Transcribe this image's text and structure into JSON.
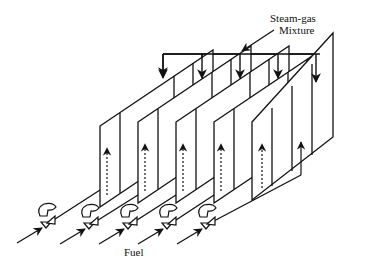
{
  "diagram": {
    "type": "schematic",
    "labels": {
      "steam_gas_line1": "Steam-gas",
      "steam_gas_line2": "Mixture",
      "fuel": "Fuel"
    },
    "panels": [
      {
        "id": 1,
        "left_x": 100
      },
      {
        "id": 2,
        "left_x": 138
      },
      {
        "id": 3,
        "left_x": 176
      },
      {
        "id": 4,
        "left_x": 214
      },
      {
        "id": 5,
        "left_x": 252
      }
    ],
    "burners": [
      {
        "id": 1,
        "x": 45
      },
      {
        "id": 2,
        "x": 88
      },
      {
        "id": 3,
        "x": 127
      },
      {
        "id": 4,
        "x": 166
      },
      {
        "id": 5,
        "x": 205
      }
    ],
    "manifold_drops": [
      163,
      202,
      240,
      278,
      316
    ],
    "colors": {
      "line": "#111111",
      "background": "#ffffff"
    }
  }
}
